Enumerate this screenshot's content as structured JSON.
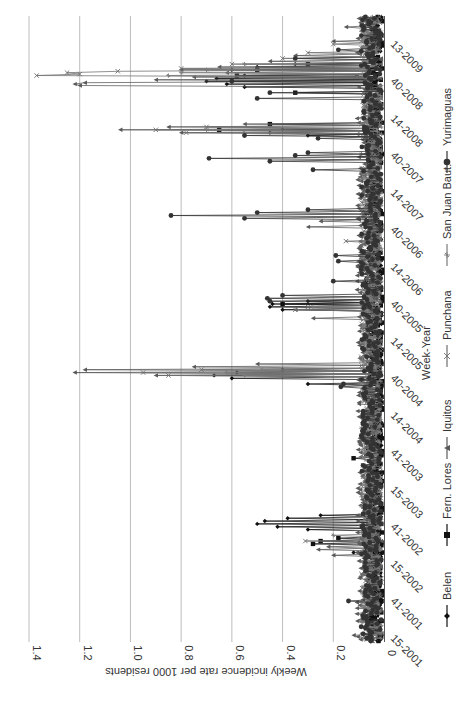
{
  "chart_data": {
    "type": "line",
    "orientation": "rotated-90-ccw",
    "title": "",
    "xlabel": "Week-Year",
    "ylabel": "Weekly incidence rate per 1000 residents",
    "ylim": [
      0,
      1.4
    ],
    "yticks": [
      "0",
      "0.2",
      "0.4",
      "0.6",
      "0.8",
      "1.0",
      "1.2",
      "1.4"
    ],
    "ytick_values": [
      0,
      0.2,
      0.4,
      0.6,
      0.8,
      1.0,
      1.2,
      1.4
    ],
    "xtick_labels": [
      "15-2001",
      "41-2001",
      "15-2002",
      "41-2002",
      "15-2003",
      "41-2003",
      "14-2004",
      "40-2004",
      "14-2005",
      "40-2005",
      "14-2006",
      "40-2006",
      "14-2007",
      "40-2007",
      "14-2008",
      "40-2008",
      "13-2009"
    ],
    "xtick_week_index": [
      0,
      26,
      52,
      78,
      104,
      130,
      156,
      182,
      208,
      234,
      260,
      286,
      312,
      338,
      364,
      390,
      416
    ],
    "total_weeks": 438,
    "grid": "horizontal-major",
    "legend_position": "bottom",
    "series": [
      {
        "name": "Belen",
        "marker": "diamond",
        "color": "#111111",
        "baseline": 0.04,
        "peaks": [
          [
            62,
            0.12
          ],
          [
            78,
            0.3
          ],
          [
            80,
            0.42
          ],
          [
            82,
            0.5
          ],
          [
            84,
            0.47
          ],
          [
            86,
            0.38
          ],
          [
            88,
            0.25
          ],
          [
            180,
            0.3
          ],
          [
            184,
            0.6
          ],
          [
            186,
            0.67
          ],
          [
            188,
            0.58
          ],
          [
            190,
            0.4
          ],
          [
            232,
            0.4
          ],
          [
            234,
            0.45
          ],
          [
            236,
            0.44
          ],
          [
            238,
            0.3
          ],
          [
            354,
            0.3
          ],
          [
            356,
            0.45
          ],
          [
            358,
            0.4
          ],
          [
            388,
            0.55
          ],
          [
            390,
            0.62
          ],
          [
            392,
            0.7
          ],
          [
            394,
            0.66
          ],
          [
            396,
            0.55
          ],
          [
            400,
            0.6
          ],
          [
            402,
            0.5
          ],
          [
            404,
            0.35
          ]
        ]
      },
      {
        "name": "Fern. Lores",
        "marker": "square",
        "color": "#111111",
        "baseline": 0.03,
        "peaks": [
          [
            68,
            0.28
          ],
          [
            70,
            0.25
          ],
          [
            72,
            0.18
          ],
          [
            128,
            0.12
          ],
          [
            236,
            0.4
          ],
          [
            358,
            0.65
          ],
          [
            362,
            0.45
          ],
          [
            384,
            0.35
          ],
          [
            396,
            0.58
          ],
          [
            400,
            0.5
          ],
          [
            404,
            0.3
          ]
        ]
      },
      {
        "name": "Iquitos",
        "marker": "triangle",
        "color": "#5a5a5a",
        "baseline": 0.06,
        "peaks": [
          [
            4,
            0.12
          ],
          [
            20,
            0.08
          ],
          [
            60,
            0.2
          ],
          [
            64,
            0.26
          ],
          [
            66,
            0.22
          ],
          [
            140,
            0.1
          ],
          [
            186,
            0.9
          ],
          [
            188,
            1.22
          ],
          [
            190,
            1.18
          ],
          [
            192,
            0.75
          ],
          [
            194,
            0.5
          ],
          [
            226,
            0.28
          ],
          [
            232,
            0.35
          ],
          [
            290,
            0.3
          ],
          [
            294,
            0.25
          ],
          [
            356,
            0.8
          ],
          [
            358,
            1.04
          ],
          [
            360,
            0.85
          ],
          [
            362,
            0.55
          ],
          [
            389,
            1.2
          ],
          [
            390,
            1.22
          ],
          [
            391,
            1.18
          ],
          [
            393,
            0.9
          ],
          [
            395,
            0.75
          ],
          [
            398,
            0.62
          ],
          [
            400,
            0.8
          ],
          [
            402,
            0.65
          ],
          [
            406,
            0.45
          ],
          [
            410,
            0.35
          ],
          [
            420,
            0.2
          ],
          [
            430,
            0.15
          ]
        ]
      },
      {
        "name": "Punchana",
        "marker": "x",
        "color": "#6e6e6e",
        "baseline": 0.05,
        "peaks": [
          [
            70,
            0.31
          ],
          [
            186,
            0.85
          ],
          [
            188,
            0.95
          ],
          [
            190,
            0.72
          ],
          [
            232,
            0.35
          ],
          [
            234,
            0.3
          ],
          [
            280,
            0.15
          ],
          [
            356,
            0.78
          ],
          [
            358,
            0.9
          ],
          [
            360,
            0.7
          ],
          [
            396,
            1.37
          ],
          [
            397,
            1.2
          ],
          [
            398,
            1.25
          ],
          [
            399,
            1.05
          ],
          [
            401,
            0.8
          ],
          [
            404,
            0.6
          ],
          [
            408,
            0.4
          ],
          [
            412,
            0.3
          ],
          [
            418,
            0.2
          ]
        ]
      },
      {
        "name": "San Juan Baut.",
        "marker": "star",
        "color": "#7a7a7a",
        "baseline": 0.05,
        "peaks": [
          [
            74,
            0.2
          ],
          [
            186,
            0.55
          ],
          [
            188,
            0.62
          ],
          [
            190,
            0.48
          ],
          [
            234,
            0.28
          ],
          [
            356,
            0.55
          ],
          [
            358,
            0.7
          ],
          [
            396,
            0.85
          ],
          [
            398,
            0.8
          ],
          [
            400,
            0.7
          ],
          [
            404,
            0.55
          ]
        ]
      },
      {
        "name": "Yurimaguas",
        "marker": "circle",
        "color": "#333333",
        "baseline": 0.05,
        "peaks": [
          [
            28,
            0.14
          ],
          [
            178,
            0.17
          ],
          [
            180,
            0.16
          ],
          [
            238,
            0.45
          ],
          [
            240,
            0.46
          ],
          [
            242,
            0.4
          ],
          [
            252,
            0.2
          ],
          [
            266,
            0.18
          ],
          [
            270,
            0.19
          ],
          [
            296,
            0.55
          ],
          [
            298,
            0.84
          ],
          [
            300,
            0.5
          ],
          [
            302,
            0.3
          ],
          [
            330,
            0.28
          ],
          [
            336,
            0.45
          ],
          [
            338,
            0.69
          ],
          [
            340,
            0.35
          ],
          [
            342,
            0.3
          ],
          [
            352,
            0.26
          ],
          [
            354,
            0.55
          ],
          [
            380,
            0.5
          ],
          [
            384,
            0.45
          ],
          [
            392,
            0.6
          ],
          [
            408,
            0.35
          ],
          [
            414,
            0.18
          ]
        ]
      }
    ]
  }
}
